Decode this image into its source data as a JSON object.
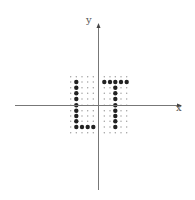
{
  "diagram": {
    "axes": {
      "x_label": "x",
      "y_label": "y",
      "origin": [
        98.5,
        105.5
      ],
      "x_range_px": [
        15,
        182
      ],
      "y_range_px": [
        23,
        190
      ],
      "color": "#777777"
    },
    "grid": {
      "columns_px": [
        70.7,
        76.3,
        82.0,
        87.7,
        93.3,
        104.3,
        110.0,
        115.3,
        121.0,
        126.7
      ],
      "rows_px": [
        76.7,
        82.0,
        87.7,
        93.3,
        99.0,
        105.3,
        110.7,
        116.0,
        121.3,
        127.0,
        132.7
      ],
      "small_dot_radius": 0.7,
      "small_dot_color": "#9a9a9a"
    },
    "large_dots": {
      "radius": 2.2,
      "color": "#222222",
      "cells": [
        [
          1,
          1
        ],
        [
          1,
          2
        ],
        [
          1,
          3
        ],
        [
          1,
          4
        ],
        [
          1,
          5
        ],
        [
          1,
          6
        ],
        [
          1,
          7
        ],
        [
          1,
          8
        ],
        [
          1,
          9
        ],
        [
          2,
          9
        ],
        [
          3,
          9
        ],
        [
          4,
          9
        ],
        [
          5,
          1
        ],
        [
          6,
          1
        ],
        [
          7,
          1
        ],
        [
          8,
          1
        ],
        [
          9,
          1
        ],
        [
          7,
          2
        ],
        [
          7,
          3
        ],
        [
          7,
          4
        ],
        [
          7,
          5
        ],
        [
          7,
          6
        ],
        [
          7,
          7
        ],
        [
          7,
          8
        ],
        [
          7,
          9
        ]
      ]
    }
  }
}
